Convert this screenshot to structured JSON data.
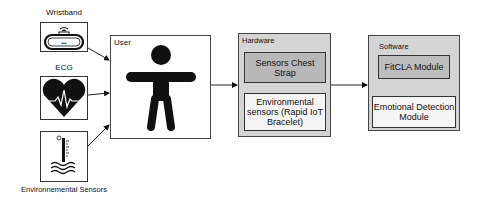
{
  "inputs": {
    "wristband": {
      "label": "Wristband",
      "icon": "wristband-icon"
    },
    "ecg": {
      "label": "ECG",
      "icon": "heart-ecg-icon"
    },
    "environmental": {
      "label": "Environnemental Sensors",
      "icon": "thermometer-icon"
    }
  },
  "user": {
    "title": "User",
    "icon": "person-icon"
  },
  "hardware": {
    "title": "Hardware",
    "chest_strap": "Sensors Chest Strap",
    "environmental": "Environmental sensors (Rapid IoT Bracelet)"
  },
  "software": {
    "title": "Software",
    "fitcla": "FitCLA Module",
    "emotional": "Emotional Detection Module"
  },
  "colors": {
    "hardware_bg": "#d4d4d4",
    "chest_strap_bg": "#b8b8b8",
    "software_bg": "#d4d4d4",
    "fitcla_bg": "#bdbdbd",
    "inner_light_bg": "#f4f4f4"
  }
}
